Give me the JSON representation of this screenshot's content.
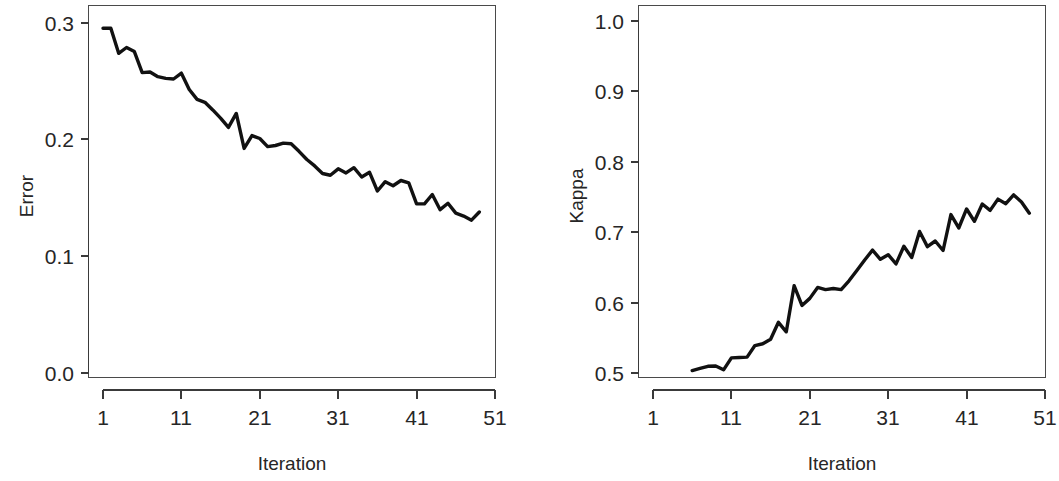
{
  "figure": {
    "background": "#ffffff",
    "line_color": "#111111",
    "axis_color": "#3a3a3a",
    "panel_count": 2
  },
  "chart_data": [
    {
      "type": "line",
      "title": "",
      "panel": "left",
      "xlabel": "Iteration",
      "ylabel": "Error",
      "xlim": [
        1,
        51
      ],
      "ylim": [
        0.0,
        0.3
      ],
      "xticks": [
        1,
        11,
        21,
        31,
        41,
        51
      ],
      "xtick_labels": [
        "1",
        "11",
        "21",
        "31",
        "41",
        "51"
      ],
      "yticks": [
        0.0,
        0.1,
        0.2,
        0.3
      ],
      "ytick_labels": [
        "0.0",
        "0.1",
        "0.2",
        "0.3"
      ],
      "grid": false,
      "legend": "none",
      "x": [
        1,
        2,
        3,
        4,
        5,
        6,
        7,
        8,
        9,
        10,
        11,
        12,
        13,
        14,
        15,
        16,
        17,
        18,
        19,
        20,
        21,
        22,
        23,
        24,
        25,
        26,
        27,
        28,
        29,
        30,
        31,
        32,
        33,
        34,
        35,
        36,
        37,
        38,
        39,
        40,
        41,
        42,
        43,
        44,
        45,
        46,
        47,
        48,
        49
      ],
      "values": [
        0.2955,
        0.2955,
        0.274,
        0.279,
        0.2755,
        0.2575,
        0.258,
        0.254,
        0.2525,
        0.252,
        0.257,
        0.243,
        0.2345,
        0.232,
        0.2255,
        0.2185,
        0.2105,
        0.2225,
        0.1925,
        0.2035,
        0.201,
        0.194,
        0.195,
        0.197,
        0.1965,
        0.19,
        0.183,
        0.1775,
        0.171,
        0.1695,
        0.175,
        0.1715,
        0.176,
        0.168,
        0.172,
        0.156,
        0.164,
        0.1605,
        0.165,
        0.163,
        0.145,
        0.145,
        0.153,
        0.14,
        0.1455,
        0.137,
        0.1345,
        0.131,
        0.138
      ]
    },
    {
      "type": "line",
      "title": "",
      "panel": "right",
      "xlabel": "Iteration",
      "ylabel": "Kappa",
      "xlim": [
        1,
        51
      ],
      "ylim": [
        0.5,
        1.0
      ],
      "xticks": [
        1,
        11,
        21,
        31,
        41,
        51
      ],
      "xtick_labels": [
        "1",
        "11",
        "21",
        "31",
        "41",
        "51"
      ],
      "yticks": [
        0.5,
        0.6,
        0.7,
        0.8,
        0.9,
        1.0
      ],
      "ytick_labels": [
        "0.5",
        "0.6",
        "0.7",
        "0.8",
        "0.9",
        "1.0"
      ],
      "grid": false,
      "legend": "none",
      "x": [
        6,
        7,
        8,
        9,
        10,
        11,
        12,
        13,
        14,
        15,
        16,
        17,
        18,
        19,
        20,
        21,
        22,
        23,
        24,
        25,
        26,
        27,
        28,
        29,
        30,
        31,
        32,
        33,
        34,
        35,
        36,
        37,
        38,
        39,
        40,
        41,
        42,
        43,
        44,
        45,
        46,
        47,
        48,
        49
      ],
      "values": [
        0.5035,
        0.5065,
        0.5095,
        0.51,
        0.5045,
        0.5215,
        0.522,
        0.5225,
        0.539,
        0.5415,
        0.548,
        0.572,
        0.5585,
        0.624,
        0.596,
        0.606,
        0.6215,
        0.6185,
        0.62,
        0.6185,
        0.631,
        0.6455,
        0.6605,
        0.6745,
        0.6615,
        0.668,
        0.655,
        0.68,
        0.664,
        0.701,
        0.6795,
        0.6875,
        0.674,
        0.725,
        0.706,
        0.733,
        0.7155,
        0.74,
        0.731,
        0.747,
        0.7405,
        0.753,
        0.743,
        0.727
      ]
    }
  ],
  "left_panel": {
    "ylabel": "Error",
    "xlabel": "Iteration",
    "ytick_labels": [
      "0.3",
      "0.2",
      "0.1",
      "0.0"
    ],
    "xtick_labels": [
      "1",
      "11",
      "21",
      "31",
      "41",
      "51"
    ]
  },
  "right_panel": {
    "ylabel": "Kappa",
    "xlabel": "Iteration",
    "ytick_labels": [
      "1.0",
      "0.9",
      "0.8",
      "0.7",
      "0.6",
      "0.5"
    ],
    "xtick_labels": [
      "1",
      "11",
      "21",
      "31",
      "41",
      "51"
    ]
  }
}
